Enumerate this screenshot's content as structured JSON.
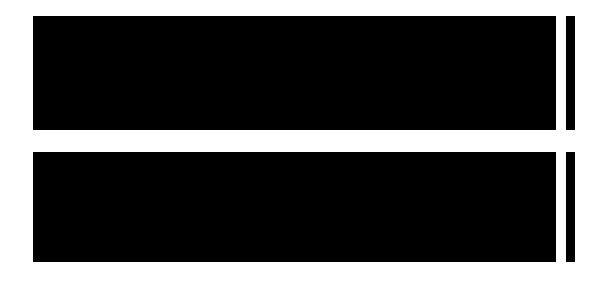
{
  "figure": {
    "title": "",
    "background_color": "#ffffff",
    "width": 604,
    "height": 293
  },
  "chart_data": [
    {
      "type": "heatmap",
      "panel": "top",
      "title": "",
      "xlabel": "",
      "ylabel": "",
      "colormap": "gray",
      "xlim": [
        0,
        4350
      ],
      "ylim": [
        0,
        2100
      ],
      "xticks": [
        500,
        1000,
        1500,
        2000,
        2500,
        3000,
        3500,
        4000
      ],
      "xtick_labels": [
        "500",
        "1000",
        "1500",
        "2000",
        "2500",
        "3000",
        "3500",
        "4000"
      ],
      "yticks": [
        200,
        400,
        600,
        800,
        1000,
        1200,
        1400,
        1600,
        1800,
        2000
      ],
      "ytick_labels": [
        "200",
        "400",
        "600",
        "800",
        "1000",
        "1200",
        "1400",
        "1600",
        "1800",
        "2000"
      ],
      "grid": false,
      "colorbar": {
        "position": "right",
        "vmin": 100,
        "vmax": 2100,
        "ticks": [
          200,
          400,
          600,
          800,
          1000,
          1200,
          1400,
          1600,
          1800,
          2000
        ],
        "tick_labels": [
          "200",
          "400",
          "600",
          "800",
          "1000",
          "1200",
          "1400",
          "1600",
          "1800",
          "2000"
        ]
      },
      "description": "Dense grayscale interference / contour field with bright lobed ridges and dark basins; brightest structure in the left half, darker toward the right.",
      "features": [
        {
          "name": "bright-lobe",
          "x": 800,
          "y": 1850,
          "intensity": 1950
        },
        {
          "name": "bright-lobe",
          "x": 1550,
          "y": 1450,
          "intensity": 2050
        },
        {
          "name": "saddle-point",
          "x": 480,
          "y": 1020,
          "intensity": 900
        },
        {
          "name": "ring-center",
          "x": 640,
          "y": 560,
          "intensity": 700
        },
        {
          "name": "ring-center",
          "x": 1100,
          "y": 560,
          "intensity": 650
        },
        {
          "name": "ring-center",
          "x": 1950,
          "y": 720,
          "intensity": 620
        },
        {
          "name": "ring-center",
          "x": 3050,
          "y": 1050,
          "intensity": 1000
        },
        {
          "name": "ring-center",
          "x": 3800,
          "y": 900,
          "intensity": 820
        }
      ]
    },
    {
      "type": "heatmap",
      "panel": "bottom",
      "title": "",
      "xlabel": "",
      "ylabel": "",
      "colormap": "gray",
      "xlim": [
        0,
        4350
      ],
      "ylim": [
        0,
        2100
      ],
      "xticks": [
        500,
        1000,
        1500,
        2000,
        2500,
        3000,
        3500,
        4000
      ],
      "xtick_labels": [
        "500",
        "1000",
        "1500",
        "2000",
        "2500",
        "3000",
        "3500",
        "4000"
      ],
      "yticks": [
        200,
        400,
        600,
        800,
        1000,
        1200,
        1400,
        1600,
        1800,
        2000
      ],
      "ytick_labels": [
        "200",
        "400",
        "600",
        "800",
        "1000",
        "1200",
        "1400",
        "1600",
        "1800",
        "2000"
      ],
      "grid": false,
      "colorbar": {
        "position": "right",
        "vmin": 250,
        "vmax": 2700,
        "ticks": [
          500,
          1000,
          1500,
          2000,
          2500
        ],
        "tick_labels": [
          "500",
          "1000",
          "1500",
          "2000",
          "2500"
        ]
      },
      "description": "Second dense grayscale interference / contour field, brighter overall with multiple concentric ring systems along the lower edge and a strong saddle near the upper right.",
      "features": [
        {
          "name": "ring-center",
          "x": 620,
          "y": 640,
          "intensity": 900
        },
        {
          "name": "ring-center",
          "x": 1180,
          "y": 620,
          "intensity": 1000
        },
        {
          "name": "bright-lobe",
          "x": 1720,
          "y": 1300,
          "intensity": 2400
        },
        {
          "name": "bright-lobe",
          "x": 2350,
          "y": 1450,
          "intensity": 2500
        },
        {
          "name": "ring-center",
          "x": 2900,
          "y": 700,
          "intensity": 1200
        },
        {
          "name": "ring-center",
          "x": 3450,
          "y": 650,
          "intensity": 1150
        },
        {
          "name": "saddle-point",
          "x": 3850,
          "y": 1700,
          "intensity": 1600
        }
      ]
    }
  ]
}
